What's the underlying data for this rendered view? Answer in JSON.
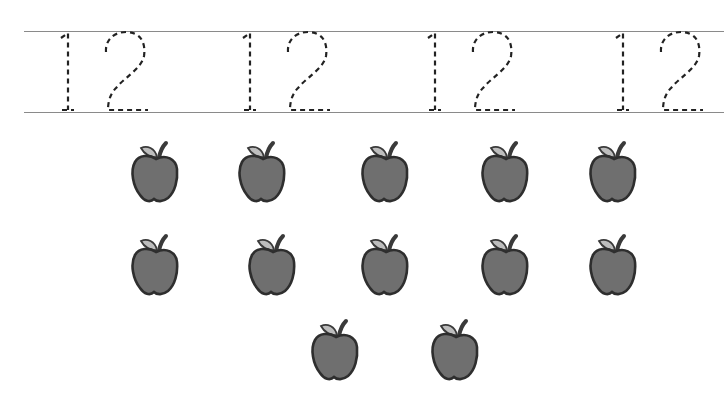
{
  "worksheet": {
    "tracing_number": "12",
    "trace_copies": 4,
    "trace_positions_x": [
      58,
      240,
      425,
      613
    ],
    "apple_count": 12,
    "apple_rows": [
      {
        "count": 5,
        "y": 140,
        "x": [
          129,
          236,
          359,
          479,
          587
        ]
      },
      {
        "count": 5,
        "y": 233,
        "x": [
          129,
          246,
          359,
          479,
          587
        ]
      },
      {
        "count": 2,
        "y": 318,
        "x": [
          309,
          429
        ]
      }
    ],
    "colors": {
      "apple_body": "#6f6f6f",
      "apple_outline": "#2e2e2e",
      "leaf": "#bdbdbd",
      "stem": "#3a3a3a",
      "rule_line": "#8a8a8a",
      "dash": "#222222"
    }
  }
}
